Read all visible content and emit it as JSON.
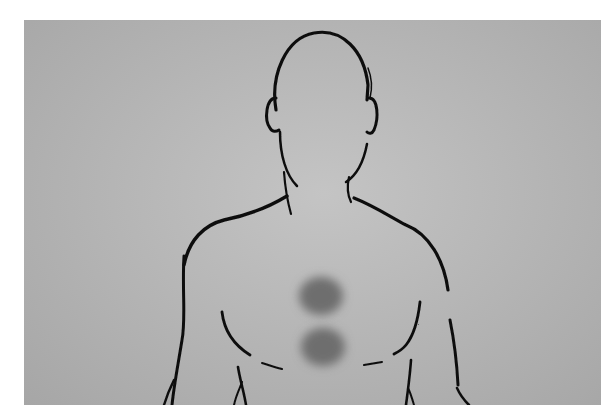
{
  "image": {
    "description": "Line drawing of a human head and torso on a gray background with two dark blurred spots on the center of the chest",
    "colors": {
      "background_outer": "#a6a6a6",
      "background_center": "#c4c4c4",
      "outline": "#111111",
      "spot": "#6e6e6e"
    },
    "spots": [
      {
        "label": "upper-chest-spot",
        "cx": 296,
        "cy": 275,
        "rx": 24,
        "ry": 20
      },
      {
        "label": "lower-chest-spot",
        "cx": 298,
        "cy": 326,
        "rx": 24,
        "ry": 20
      }
    ]
  }
}
